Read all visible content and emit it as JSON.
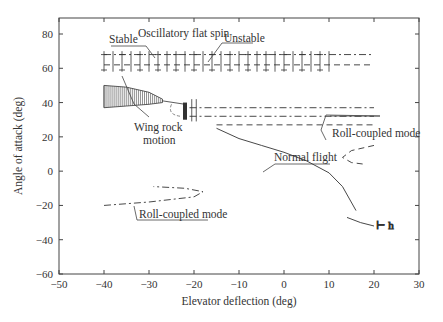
{
  "chart_data": {
    "type": "line",
    "title": "",
    "xlabel": "Elevator deflection (deg)",
    "ylabel": "Angle of attack (deg)",
    "xlim": [
      -50,
      30
    ],
    "ylim": [
      -60,
      89
    ],
    "xticks": [
      -50,
      -40,
      -30,
      -20,
      -10,
      0,
      10,
      20,
      30
    ],
    "yticks": [
      -60,
      -40,
      -20,
      0,
      20,
      40,
      60,
      80
    ],
    "grid": false,
    "legend": null,
    "annotations": [
      {
        "text": "Stable",
        "x": -36,
        "y": 77
      },
      {
        "text": "Oscillatory flat spin",
        "x": -13,
        "y": 78
      },
      {
        "text": "Unstable",
        "x": 5,
        "y": 75
      },
      {
        "text": "Wing rock",
        "x": -23,
        "y": 14
      },
      {
        "text": "motion",
        "x": -23,
        "y": 7
      },
      {
        "text": "Normal flight",
        "x": 6,
        "y": 3
      },
      {
        "text": "Roll-coupled mode",
        "x": 22,
        "y": 16
      },
      {
        "text": "Roll-coupled mode",
        "x": -24,
        "y": -26
      }
    ],
    "series": [
      {
        "name": "Oscillatory flat spin - upper (stable region, bars)",
        "style": "bars",
        "x": [
          -40,
          10
        ],
        "y_top": 70,
        "y_bottom": 58
      },
      {
        "name": "Flat spin upper branch",
        "style": "dash-dot",
        "x": [
          -40,
          20
        ],
        "y": [
          68,
          68
        ]
      },
      {
        "name": "Flat spin lower branch",
        "style": "dashed",
        "x": [
          -40,
          20
        ],
        "y": [
          62,
          62
        ]
      },
      {
        "name": "Wing rock motion",
        "style": "hatched",
        "x": [
          -40,
          -35,
          -30,
          -27
        ],
        "y_top": [
          50,
          49,
          46,
          42
        ],
        "y_bottom": [
          37,
          38,
          39,
          40
        ]
      },
      {
        "name": "Wing rock transition",
        "style": "solid-thick",
        "x": [
          -22,
          -22
        ],
        "y": [
          30,
          40
        ]
      },
      {
        "name": "High-alpha branch 1",
        "style": "dash-dot",
        "x": [
          -21,
          20
        ],
        "y": [
          37,
          37
        ]
      },
      {
        "name": "High-alpha branch 2",
        "style": "dash-dot",
        "x": [
          -21,
          20
        ],
        "y": [
          32,
          32
        ]
      },
      {
        "name": "High-alpha branch 3",
        "style": "dashed",
        "x": [
          -15,
          20
        ],
        "y": [
          27,
          27
        ]
      },
      {
        "name": "Normal flight",
        "style": "solid",
        "x": [
          -15,
          -10,
          -5,
          0,
          5,
          10,
          13,
          16
        ],
        "y": [
          25,
          19,
          15,
          11,
          6,
          -1,
          -9,
          -23
        ]
      },
      {
        "name": "Normal flight tail",
        "style": "solid",
        "x": [
          14,
          17,
          20
        ],
        "y": [
          -27,
          -30,
          -32
        ]
      },
      {
        "name": "Roll-coupled mode (right)",
        "style": "dashed",
        "x": [
          20,
          15,
          13,
          15,
          18
        ],
        "y": [
          15,
          12,
          8,
          5,
          4
        ]
      },
      {
        "name": "Roll-coupled mode (left)",
        "style": "dash-dot",
        "x": [
          -40,
          -30,
          -20,
          -18,
          -22,
          -29
        ],
        "y": [
          -20,
          -18,
          -15,
          -12,
          -10,
          -9
        ]
      }
    ]
  },
  "axes": {
    "xlabel": "Elevator deflection (deg)",
    "ylabel": "Angle of attack (deg)",
    "xtick_labels": [
      "−50",
      "−40",
      "−30",
      "−20",
      "−10",
      "0",
      "10",
      "20",
      "30"
    ],
    "ytick_labels": [
      "−60",
      "−40",
      "−20",
      "0",
      "20",
      "40",
      "60",
      "80"
    ]
  },
  "labels": {
    "stable": "Stable",
    "flat_spin": "Oscillatory flat spin",
    "unstable": "Unstable",
    "wing_rock_1": "Wing rock",
    "wing_rock_2": "motion",
    "normal_flight": "Normal flight",
    "roll_coupled_right": "Roll-coupled mode",
    "roll_coupled_left": "Roll-coupled mode"
  }
}
